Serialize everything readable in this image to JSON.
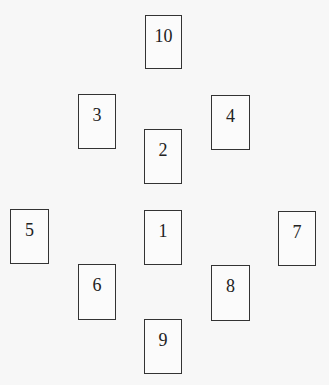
{
  "diagram": {
    "title": "",
    "cards": [
      {
        "label": "10",
        "x": 145,
        "y": 15,
        "w": 37,
        "h": 54
      },
      {
        "label": "3",
        "x": 78,
        "y": 94,
        "w": 38,
        "h": 55
      },
      {
        "label": "4",
        "x": 211,
        "y": 95,
        "w": 39,
        "h": 55
      },
      {
        "label": "2",
        "x": 144,
        "y": 129,
        "w": 38,
        "h": 55
      },
      {
        "label": "5",
        "x": 10,
        "y": 209,
        "w": 39,
        "h": 55
      },
      {
        "label": "1",
        "x": 144,
        "y": 210,
        "w": 38,
        "h": 55
      },
      {
        "label": "7",
        "x": 278,
        "y": 211,
        "w": 38,
        "h": 55
      },
      {
        "label": "6",
        "x": 78,
        "y": 264,
        "w": 38,
        "h": 56
      },
      {
        "label": "8",
        "x": 211,
        "y": 265,
        "w": 39,
        "h": 56
      },
      {
        "label": "9",
        "x": 144,
        "y": 319,
        "w": 38,
        "h": 55
      }
    ]
  }
}
